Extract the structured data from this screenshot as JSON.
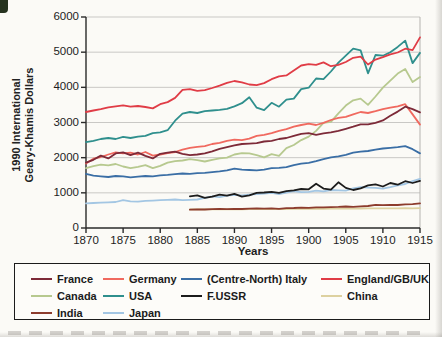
{
  "figure": {
    "y_axis_title_line1": "1990 International",
    "y_axis_title_line2": "Geary-Khamis Dollars",
    "x_axis_title": "Years"
  },
  "colors": {
    "axis": "#2a2a2a",
    "gridline": "#c9c8c5",
    "plot_right_border": "#b5b3af",
    "legend_border": "#1b1b1b"
  },
  "chart_data": {
    "type": "line",
    "title": "",
    "xlabel": "Years",
    "ylabel": "1990 International Geary-Khamis Dollars",
    "xlim": [
      1870,
      1915
    ],
    "ylim": [
      0,
      6000
    ],
    "xticks": [
      1870,
      1875,
      1880,
      1885,
      1890,
      1895,
      1900,
      1905,
      1910,
      1915
    ],
    "yticks": [
      0,
      1000,
      2000,
      3000,
      4000,
      5000,
      6000
    ],
    "grid": "horizontal",
    "legend_position": "bottom-box",
    "x_step": 1,
    "series": [
      {
        "name": "France",
        "color": "#7d2a38",
        "start_year": 1870,
        "values": [
          1860,
          1940,
          2060,
          1980,
          2120,
          2150,
          2070,
          2140,
          2050,
          1980,
          2110,
          2140,
          2170,
          2110,
          2070,
          2090,
          2120,
          2180,
          2250,
          2300,
          2350,
          2390,
          2400,
          2410,
          2460,
          2480,
          2530,
          2560,
          2620,
          2680,
          2700,
          2650,
          2690,
          2720,
          2760,
          2820,
          2880,
          2950,
          2950,
          2990,
          3060,
          3190,
          3310,
          3450,
          3380,
          3290
        ]
      },
      {
        "name": "Germany",
        "color": "#f0695f",
        "start_year": 1870,
        "values": [
          1830,
          1970,
          2020,
          2090,
          2150,
          2120,
          2140,
          2090,
          2160,
          2060,
          2090,
          2130,
          2160,
          2230,
          2280,
          2310,
          2330,
          2390,
          2420,
          2480,
          2510,
          2500,
          2540,
          2620,
          2650,
          2700,
          2760,
          2810,
          2880,
          2930,
          2970,
          2930,
          2990,
          3070,
          3130,
          3160,
          3230,
          3300,
          3270,
          3320,
          3380,
          3420,
          3460,
          3520,
          3230,
          2940
        ]
      },
      {
        "name": "(Centre-North) Italy",
        "color": "#3a6ea5",
        "start_year": 1870,
        "values": [
          1540,
          1490,
          1470,
          1450,
          1480,
          1470,
          1440,
          1460,
          1480,
          1470,
          1500,
          1510,
          1530,
          1550,
          1540,
          1560,
          1570,
          1590,
          1610,
          1640,
          1690,
          1660,
          1650,
          1640,
          1660,
          1700,
          1710,
          1730,
          1790,
          1830,
          1850,
          1900,
          1960,
          2010,
          2040,
          2080,
          2140,
          2170,
          2190,
          2230,
          2260,
          2280,
          2300,
          2330,
          2240,
          2120
        ]
      },
      {
        "name": "England/GB/UK",
        "color": "#e03c46",
        "start_year": 1870,
        "values": [
          3300,
          3340,
          3380,
          3430,
          3460,
          3490,
          3450,
          3470,
          3440,
          3400,
          3520,
          3580,
          3700,
          3930,
          3950,
          3900,
          3920,
          3980,
          4050,
          4130,
          4180,
          4140,
          4080,
          4060,
          4120,
          4230,
          4310,
          4340,
          4480,
          4620,
          4660,
          4640,
          4710,
          4600,
          4640,
          4720,
          4840,
          4870,
          4650,
          4790,
          4860,
          4940,
          4990,
          5100,
          5060,
          5420
        ]
      },
      {
        "name": "Canada",
        "color": "#b7c98f",
        "start_year": 1870,
        "values": [
          1700,
          1760,
          1800,
          1780,
          1820,
          1750,
          1700,
          1740,
          1790,
          1700,
          1770,
          1860,
          1900,
          1920,
          1960,
          1930,
          1890,
          1940,
          1980,
          2000,
          2090,
          2130,
          2120,
          2070,
          2010,
          2100,
          2050,
          2270,
          2360,
          2500,
          2600,
          2760,
          2990,
          3020,
          3260,
          3480,
          3630,
          3680,
          3500,
          3740,
          3990,
          4190,
          4390,
          4520,
          4150,
          4290
        ]
      },
      {
        "name": "USA",
        "color": "#2f8f8d",
        "start_year": 1870,
        "values": [
          2440,
          2480,
          2530,
          2560,
          2530,
          2590,
          2560,
          2600,
          2620,
          2700,
          2720,
          2780,
          3050,
          3250,
          3300,
          3270,
          3320,
          3340,
          3360,
          3390,
          3460,
          3550,
          3720,
          3420,
          3350,
          3560,
          3450,
          3650,
          3680,
          3950,
          3990,
          4250,
          4230,
          4450,
          4700,
          4900,
          5100,
          5050,
          4400,
          4920,
          4900,
          5000,
          5150,
          5330,
          4690,
          4980
        ]
      },
      {
        "name": "F.USSR",
        "color": "#1c1c1c",
        "start_year": 1884,
        "values": [
          900,
          930,
          860,
          890,
          950,
          920,
          970,
          890,
          930,
          1000,
          1010,
          1030,
          1000,
          1050,
          1070,
          1110,
          1100,
          1260,
          1120,
          1090,
          1300,
          1140,
          1080,
          1130,
          1210,
          1240,
          1180,
          1280,
          1230,
          1330,
          1280,
          1340
        ]
      },
      {
        "name": "China",
        "color": "#ddd1a0",
        "start_year": 1884,
        "values": [
          530,
          528,
          532,
          530,
          534,
          532,
          536,
          531,
          535,
          538,
          536,
          540,
          537,
          541,
          544,
          547,
          544,
          549,
          547,
          551,
          549,
          553,
          551,
          555,
          557,
          559,
          556,
          561,
          559,
          564,
          561,
          566
        ]
      },
      {
        "name": "India",
        "color": "#8d3c2d",
        "start_year": 1884,
        "values": [
          520,
          530,
          525,
          535,
          540,
          535,
          545,
          540,
          550,
          555,
          550,
          560,
          545,
          565,
          570,
          580,
          575,
          590,
          585,
          595,
          600,
          610,
          600,
          615,
          625,
          660,
          650,
          660,
          655,
          670,
          680,
          700
        ]
      },
      {
        "name": "Japan",
        "color": "#a3c6e3",
        "start_year": 1870,
        "values": [
          700,
          710,
          720,
          730,
          740,
          790,
          760,
          750,
          770,
          780,
          790,
          800,
          810,
          790,
          800,
          810,
          860,
          900,
          880,
          920,
          940,
          930,
          950,
          960,
          980,
          1000,
          960,
          1010,
          1050,
          1020,
          1030,
          1060,
          1040,
          1080,
          1070,
          1060,
          1130,
          1160,
          1150,
          1140,
          1120,
          1160,
          1210,
          1250,
          1330,
          1400
        ]
      }
    ],
    "legend_order": [
      "France",
      "Germany",
      "(Centre-North) Italy",
      "England/GB/UK",
      "Canada",
      "USA",
      "F.USSR",
      "China",
      "India",
      "Japan"
    ],
    "draw_order": [
      "China",
      "India",
      "Japan",
      "F.USSR",
      "(Centre-North) Italy",
      "Canada",
      "Germany",
      "France",
      "USA",
      "England/GB/UK"
    ]
  }
}
